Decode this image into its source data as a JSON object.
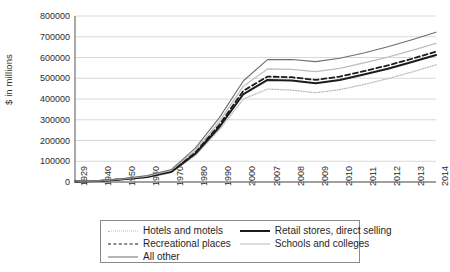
{
  "chart_data": {
    "type": "line",
    "title": "",
    "xlabel": "",
    "ylabel": "$ in millions",
    "ylim": [
      0,
      800000
    ],
    "ytick_labels": [
      "800000",
      "700000",
      "600000",
      "500000",
      "400000",
      "300000",
      "200000",
      "100000",
      "0"
    ],
    "ytick_values": [
      800000,
      700000,
      600000,
      500000,
      400000,
      300000,
      200000,
      100000,
      0
    ],
    "grid": true,
    "legend_position": "bottom",
    "categories": [
      "1929",
      "1940",
      "1950",
      "1960",
      "1970",
      "1980",
      "1990",
      "2000",
      "2007",
      "2008",
      "2009",
      "2010",
      "2011",
      "2012",
      "2013",
      "2014"
    ],
    "series": [
      {
        "name": "Hotels and  motels",
        "style": "dotted",
        "color": "#bdbdbd",
        "values": [
          2000,
          4000,
          12000,
          22000,
          45000,
          128000,
          252000,
          400000,
          448000,
          443000,
          430000,
          445000,
          470000,
          498000,
          530000,
          565000
        ]
      },
      {
        "name": "Retail stores, direct selling",
        "style": "solid-thick",
        "color": "#1b1b1b",
        "values": [
          2200,
          4400,
          13000,
          24000,
          49000,
          136000,
          265000,
          424000,
          492000,
          489000,
          476000,
          492000,
          518000,
          546000,
          578000,
          612000
        ]
      },
      {
        "name": "Recreational places",
        "style": "dashed",
        "color": "#1b1b1b",
        "values": [
          2400,
          4800,
          14000,
          26000,
          52000,
          143000,
          276000,
          440000,
          508000,
          505000,
          492000,
          508000,
          534000,
          562000,
          594000,
          628000
        ]
      },
      {
        "name": "Schools and colleges",
        "style": "solid-light",
        "color": "#bdbdbd",
        "values": [
          2700,
          5200,
          15500,
          28500,
          56000,
          152000,
          292000,
          462000,
          545000,
          543000,
          532000,
          548000,
          574000,
          602000,
          634000,
          668000
        ]
      },
      {
        "name": "All other",
        "style": "solid-thin",
        "color": "#6d6d6d",
        "values": [
          3000,
          5800,
          17000,
          31000,
          60000,
          163000,
          310000,
          488000,
          590000,
          590000,
          580000,
          596000,
          622000,
          652000,
          686000,
          722000
        ]
      }
    ]
  },
  "legend": {
    "entries": [
      {
        "label": "Hotels and  motels",
        "style": "sw-dotted"
      },
      {
        "label": "Retail stores, direct selling",
        "style": "sw-thick"
      },
      {
        "label": "Recreational places",
        "style": "sw-dashed"
      },
      {
        "label": "Schools and colleges",
        "style": "sw-light"
      },
      {
        "label": "All other",
        "style": "sw-thin"
      }
    ]
  },
  "caption": {
    "text": ""
  }
}
